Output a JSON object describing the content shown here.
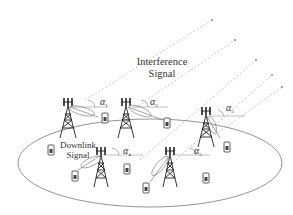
{
  "diagram": {
    "title_line1": "Interference",
    "title_line2": "Signal",
    "downlink_line1": "Downlink",
    "downlink_line2": "Signal",
    "angles": [
      {
        "symbol": "α",
        "index": "1",
        "x": 100,
        "y": 97
      },
      {
        "symbol": "α",
        "index": "2",
        "x": 150,
        "y": 97
      },
      {
        "symbol": "α",
        "index": "3",
        "x": 226,
        "y": 103
      },
      {
        "symbol": "α",
        "index": "4",
        "x": 123,
        "y": 146
      },
      {
        "symbol": "α",
        "index": "5",
        "x": 194,
        "y": 146
      }
    ],
    "colors": {
      "line": "#555555",
      "dashed": "#999999",
      "text": "#333333",
      "background": "#ffffff"
    }
  }
}
